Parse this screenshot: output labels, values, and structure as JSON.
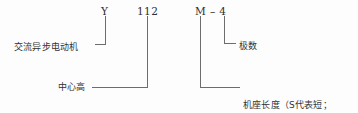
{
  "diagram": {
    "stroke_color": "#6d6d6d",
    "text_color": "#333333",
    "background": "#fdfdfd",
    "model_code": {
      "series_letter": "Y",
      "center_height": "112",
      "frame_length_and_poles": "M – 4"
    },
    "callouts": {
      "motor_type": "交流异步电动机",
      "poles": "极数",
      "center_height": "中心高",
      "frame_length_line1": "机座长度（S代表短；",
      "frame_length_line2": "M代表中；L代表长）"
    }
  }
}
